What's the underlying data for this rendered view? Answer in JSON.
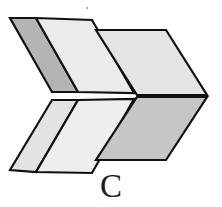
{
  "figure": {
    "label": "C",
    "caption_letter": "C",
    "kind": "3d-chevron-block",
    "canvas": {
      "width": 222,
      "height": 207,
      "background": "#ffffff"
    },
    "outline_color": "#111111",
    "outline_width": 2.2,
    "palette": {
      "dark_gray": "#b4b4b4",
      "mid_gray": "#c9c9c9",
      "light_gray": "#e9e9e9",
      "lighter_gray": "#f0f0f0",
      "pale_gray": "#dedede",
      "outline": "#111111"
    },
    "faces": [
      {
        "name": "upper-left-dark-band",
        "fill": "#b4b4b4",
        "points": "10,18 36,18 78,92 52,92"
      },
      {
        "name": "upper-left-light-band",
        "fill": "#ebebeb",
        "points": "36,18 92,20 134,93 78,92"
      },
      {
        "name": "upper-right-light-face",
        "fill": "#e4e4e4",
        "points": "96,30 166,30 207,95 137,95"
      },
      {
        "name": "lower-left-pale-band",
        "fill": "#e3e3e3",
        "points": "52,100 78,100 36,172 10,170"
      },
      {
        "name": "lower-left-light-band",
        "fill": "#eeeeee",
        "points": "78,100 134,99 92,173 36,172"
      },
      {
        "name": "lower-right-mid-face",
        "fill": "#c6c6c6",
        "points": "137,97 207,97 166,160 96,160"
      }
    ],
    "speck": {
      "x": 86,
      "y": 7,
      "color": "#9a9a9a"
    }
  }
}
